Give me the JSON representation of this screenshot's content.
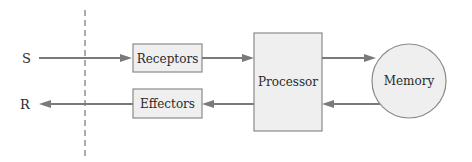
{
  "diagram": {
    "type": "block-diagram",
    "input_label": "S",
    "output_label": "R",
    "nodes": {
      "receptors": {
        "label": "Receptors",
        "shape": "rectangle"
      },
      "effectors": {
        "label": "Effectors",
        "shape": "rectangle"
      },
      "processor": {
        "label": "Processor",
        "shape": "rectangle"
      },
      "memory": {
        "label": "Memory",
        "shape": "circle"
      }
    },
    "edges": [
      {
        "from": "S",
        "to": "receptors"
      },
      {
        "from": "receptors",
        "to": "processor"
      },
      {
        "from": "processor",
        "to": "memory"
      },
      {
        "from": "memory",
        "to": "processor"
      },
      {
        "from": "processor",
        "to": "effectors"
      },
      {
        "from": "effectors",
        "to": "R"
      }
    ],
    "boundary": "dashed-vertical-line",
    "colors": {
      "box_fill": "#efefef",
      "box_stroke": "#8a8a8a",
      "arrow": "#7a7a7a",
      "text": "#2a2a2a"
    }
  }
}
